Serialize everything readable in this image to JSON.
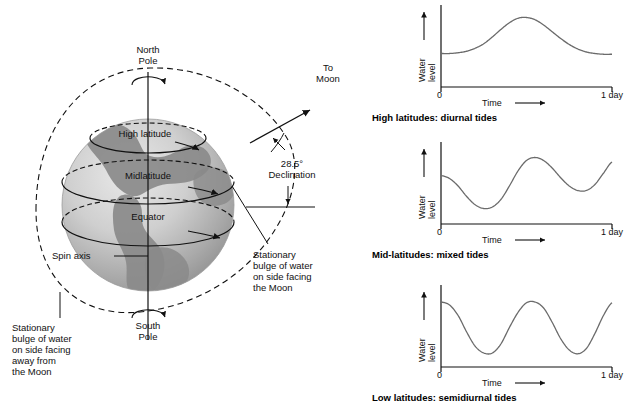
{
  "globe": {
    "north_pole": "North\nPole",
    "south_pole": "South\nPole",
    "high_latitude": "High latitude",
    "midlatitude": "Midlatitude",
    "equator": "Equator",
    "spin_axis": "Spin axis",
    "to_moon": "To\nMoon",
    "declination": "28.5°\nDeclination",
    "bulge_facing": "Stationary\nbulge of water\non side facing\nthe Moon",
    "bulge_away": "Stationary\nbulge of water\non side facing\naway from\nthe Moon"
  },
  "charts": {
    "axis": {
      "ylabel": "Water\nlevel",
      "xlabel": "Time",
      "x_start": "0",
      "x_end": "1  day"
    },
    "captions": [
      "High latitudes: diurnal tides",
      "Mid-latitudes: mixed tides",
      "Low latitudes: semidiurnal tides"
    ]
  },
  "chart_data": [
    {
      "type": "line",
      "title": "High latitudes: diurnal tides",
      "xlabel": "Time",
      "ylabel": "Water level",
      "xlim": [
        0,
        1
      ],
      "ylim": [
        0,
        1
      ],
      "x_tick_labels": [
        "0",
        "1 day"
      ],
      "grid": false,
      "legend": null,
      "x": [
        0.0,
        0.05,
        0.1,
        0.15,
        0.2,
        0.25,
        0.3,
        0.35,
        0.4,
        0.45,
        0.5,
        0.55,
        0.6,
        0.65,
        0.7,
        0.75,
        0.8,
        0.85,
        0.9,
        0.95,
        1.0
      ],
      "y": [
        0.42,
        0.42,
        0.43,
        0.45,
        0.49,
        0.55,
        0.64,
        0.74,
        0.83,
        0.89,
        0.9,
        0.87,
        0.8,
        0.71,
        0.62,
        0.54,
        0.48,
        0.44,
        0.42,
        0.41,
        0.41
      ]
    },
    {
      "type": "line",
      "title": "Mid-latitudes: mixed tides",
      "xlabel": "Time",
      "ylabel": "Water level",
      "xlim": [
        0,
        1
      ],
      "ylim": [
        0,
        1
      ],
      "x_tick_labels": [
        "0",
        "1 day"
      ],
      "grid": false,
      "legend": null,
      "x": [
        0.0,
        0.05,
        0.1,
        0.15,
        0.2,
        0.25,
        0.3,
        0.35,
        0.4,
        0.45,
        0.5,
        0.55,
        0.6,
        0.65,
        0.7,
        0.75,
        0.8,
        0.85,
        0.9,
        0.95,
        1.0
      ],
      "y": [
        0.62,
        0.58,
        0.48,
        0.34,
        0.23,
        0.18,
        0.2,
        0.3,
        0.48,
        0.68,
        0.82,
        0.86,
        0.82,
        0.72,
        0.59,
        0.48,
        0.42,
        0.42,
        0.5,
        0.65,
        0.8
      ]
    },
    {
      "type": "line",
      "title": "Low latitudes: semidiurnal tides",
      "xlabel": "Time",
      "ylabel": "Water level",
      "xlim": [
        0,
        1
      ],
      "ylim": [
        0,
        1
      ],
      "x_tick_labels": [
        "0",
        "1 day"
      ],
      "grid": false,
      "legend": null,
      "x": [
        0.0,
        0.05,
        0.1,
        0.15,
        0.2,
        0.25,
        0.3,
        0.35,
        0.4,
        0.45,
        0.5,
        0.55,
        0.6,
        0.65,
        0.7,
        0.75,
        0.8,
        0.85,
        0.9,
        0.95,
        1.0
      ],
      "y": [
        0.84,
        0.8,
        0.66,
        0.44,
        0.25,
        0.16,
        0.16,
        0.28,
        0.5,
        0.7,
        0.83,
        0.84,
        0.76,
        0.57,
        0.35,
        0.2,
        0.15,
        0.22,
        0.42,
        0.66,
        0.83
      ]
    }
  ]
}
